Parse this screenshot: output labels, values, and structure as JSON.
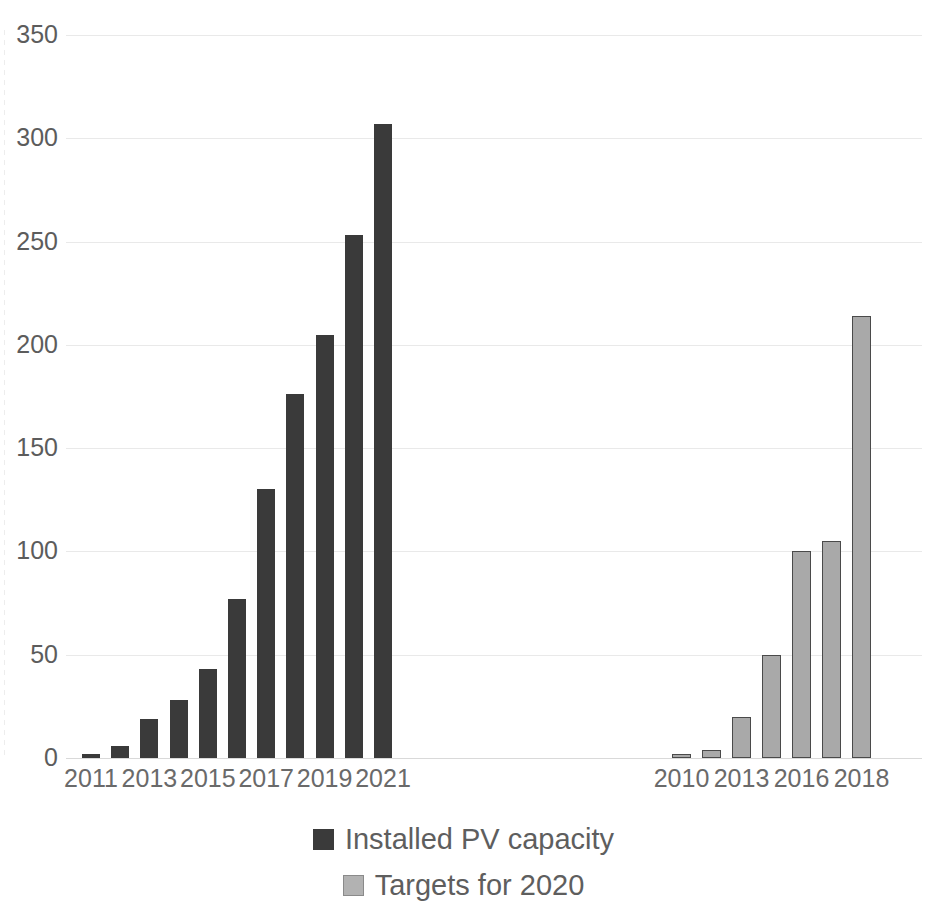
{
  "chart_data": {
    "type": "bar",
    "title": "",
    "subtitle": "",
    "xlabel": "",
    "ylabel": "",
    "ylim": [
      0,
      350
    ],
    "yticks": [
      0,
      50,
      100,
      150,
      200,
      250,
      300,
      350
    ],
    "ytick_labels": [
      "0",
      "50",
      "100",
      "150",
      "200",
      "250",
      "300",
      "350"
    ],
    "grid": true,
    "legend_position": "bottom",
    "groups": [
      {
        "name": "Installed PV capacity",
        "color": "#3a3a3a",
        "categories": [
          "2011",
          "2012",
          "2013",
          "2014",
          "2015",
          "2016",
          "2017",
          "2018",
          "2019",
          "2020",
          "2021"
        ],
        "tick_labels": [
          "2011",
          "",
          "2013",
          "",
          "2015",
          "",
          "2017",
          "",
          "2019",
          "",
          "2021"
        ],
        "values": [
          2,
          6,
          19,
          28,
          43,
          77,
          130,
          176,
          205,
          253,
          307
        ]
      },
      {
        "name": "Targets for 2020",
        "color": "#a9a9a9",
        "categories": [
          "2010",
          "2011",
          "2013",
          "2014",
          "2016",
          "2017",
          "2018"
        ],
        "tick_labels": [
          "2010",
          "",
          "2013",
          "",
          "2016",
          "",
          "2018"
        ],
        "values": [
          2,
          4,
          20,
          50,
          100,
          105,
          214
        ]
      }
    ],
    "legend": [
      {
        "label": "Installed PV capacity",
        "color": "#3a3a3a",
        "swatch": "dark"
      },
      {
        "label": "Targets for 2020",
        "color": "#b2b2b2",
        "swatch": "light"
      }
    ]
  },
  "colors": {
    "series_dark": "#3a3a3a",
    "series_light": "#a9a9a9",
    "gridline": "#e9e9e9",
    "tick_text": "#5c5c5c",
    "background": "#ffffff"
  }
}
